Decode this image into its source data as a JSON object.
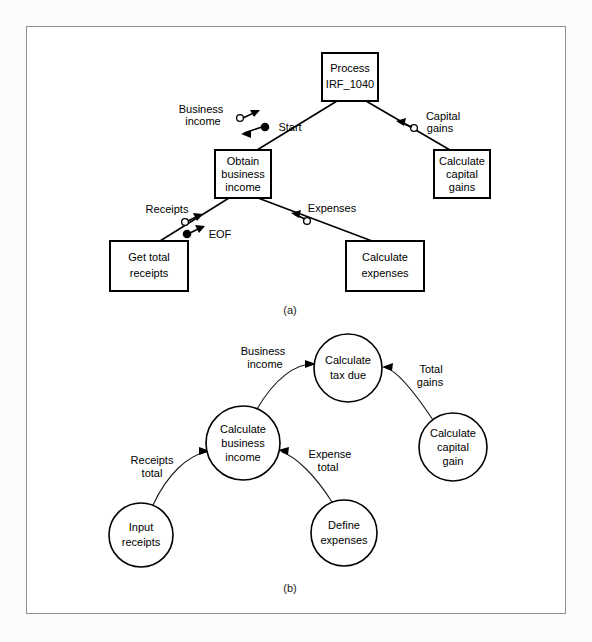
{
  "figure": {
    "caption_a": "(a)",
    "caption_b": "(b)"
  },
  "diagram_a": {
    "type": "structure-chart",
    "nodes": [
      {
        "id": "process",
        "lines": [
          "Process",
          "IRF_1040"
        ],
        "cx": 350,
        "cy": 77,
        "w": 56,
        "h": 48
      },
      {
        "id": "obtain",
        "lines": [
          "Obtain",
          "business",
          "income"
        ],
        "cx": 243,
        "cy": 174,
        "w": 56,
        "h": 48
      },
      {
        "id": "capgains",
        "lines": [
          "Calculate",
          "capital",
          "gains"
        ],
        "cx": 462,
        "cy": 174,
        "w": 56,
        "h": 48
      },
      {
        "id": "receipts",
        "lines": [
          "Get total",
          "receipts"
        ],
        "cx": 149,
        "cy": 266,
        "w": 78,
        "h": 50
      },
      {
        "id": "expenses",
        "lines": [
          "Calculate",
          "expenses"
        ],
        "cx": 385,
        "cy": 266,
        "w": 78,
        "h": 50
      }
    ],
    "edges": [
      {
        "from": "process",
        "to": "obtain",
        "labels": [
          "Business income",
          "Start"
        ]
      },
      {
        "from": "process",
        "to": "capgains",
        "labels": [
          "Capital gains"
        ]
      },
      {
        "from": "obtain",
        "to": "receipts",
        "labels": [
          "Receipts",
          "EOF"
        ]
      },
      {
        "from": "obtain",
        "to": "expenses",
        "labels": [
          "Expenses"
        ]
      }
    ],
    "labels": {
      "business_income_1": "Business",
      "business_income_2": "income",
      "start": "Start",
      "capital_1": "Capital",
      "capital_2": "gains",
      "receipts": "Receipts",
      "eof": "EOF",
      "expenses": "Expenses"
    }
  },
  "diagram_b": {
    "type": "data-flow-diagram",
    "nodes": [
      {
        "id": "tax",
        "lines": [
          "Calculate",
          "tax due"
        ],
        "cx": 348,
        "cy": 368,
        "r": 34
      },
      {
        "id": "capgain",
        "lines": [
          "Calculate",
          "capital",
          "gain"
        ],
        "cx": 453,
        "cy": 447,
        "r": 34
      },
      {
        "id": "business",
        "lines": [
          "Calculate",
          "business",
          "income"
        ],
        "cx": 243,
        "cy": 443,
        "r": 37
      },
      {
        "id": "input",
        "lines": [
          "Input",
          "receipts"
        ],
        "cx": 141,
        "cy": 535,
        "r": 32
      },
      {
        "id": "define",
        "lines": [
          "Define",
          "expenses"
        ],
        "cx": 344,
        "cy": 533,
        "r": 33
      }
    ],
    "edges": [
      {
        "from": "business",
        "to": "tax",
        "labels": [
          "Business",
          "income"
        ]
      },
      {
        "from": "capgain",
        "to": "tax",
        "labels": [
          "Total",
          "gains"
        ]
      },
      {
        "from": "input",
        "to": "business",
        "labels": [
          "Receipts",
          "total"
        ]
      },
      {
        "from": "define",
        "to": "business",
        "labels": [
          "Expense",
          "total"
        ]
      }
    ],
    "labels": {
      "business_income_1": "Business",
      "business_income_2": "income",
      "total_gains_1": "Total",
      "total_gains_2": "gains",
      "receipts_total_1": "Receipts",
      "receipts_total_2": "total",
      "expense_total_1": "Expense",
      "expense_total_2": "total"
    }
  }
}
